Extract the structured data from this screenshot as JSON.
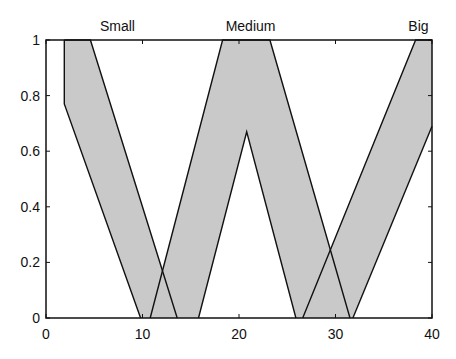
{
  "chart_data": {
    "type": "area",
    "title": "",
    "xlabel": "",
    "ylabel": "",
    "xlim": [
      0,
      40
    ],
    "ylim": [
      0,
      1
    ],
    "grid": false,
    "x_ticks": [
      0,
      10,
      20,
      30,
      40
    ],
    "x_tick_labels": [
      "0",
      "10",
      "20",
      "30",
      "40"
    ],
    "y_ticks": [
      0,
      0.2,
      0.4,
      0.6,
      0.8,
      1
    ],
    "y_tick_labels": [
      "0",
      "0.2",
      "0.4",
      "0.6",
      "0.8",
      "1"
    ],
    "fill_color": "#c9c9c9",
    "line_color": "#111111",
    "series": [
      {
        "name": "Small",
        "label_x": 7.4,
        "upper_bound": [
          [
            1.9,
            1
          ],
          [
            4.6,
            1
          ],
          [
            13.6,
            0
          ]
        ],
        "lower_bound": [
          [
            1.9,
            1
          ],
          [
            1.9,
            0.77
          ],
          [
            9.8,
            0
          ]
        ]
      },
      {
        "name": "Medium",
        "label_x": 21.2,
        "upper_bound": [
          [
            10.8,
            0
          ],
          [
            18.3,
            1
          ],
          [
            23.2,
            1
          ],
          [
            31.5,
            0
          ]
        ],
        "lower_bound": [
          [
            15.8,
            0
          ],
          [
            20.8,
            0.67
          ],
          [
            25.9,
            0
          ]
        ]
      },
      {
        "name": "Big",
        "label_x": 38.6,
        "upper_bound": [
          [
            26.6,
            0
          ],
          [
            38.3,
            1
          ],
          [
            40,
            1
          ]
        ],
        "lower_bound": [
          [
            31.8,
            0
          ],
          [
            40,
            0.69
          ]
        ]
      }
    ],
    "annotations": [
      "Small",
      "Medium",
      "Big"
    ]
  }
}
